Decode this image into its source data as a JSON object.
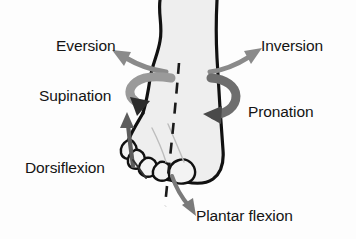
{
  "figure": {
    "background_color": "#fdfdfd",
    "text_color": "#141414"
  },
  "anatomy": {
    "subject": "right foot and lower leg, anterior view",
    "skin_fill": "#eeeeee",
    "outline_color": "#111111",
    "axis": {
      "name": "longitudinal-axis",
      "style": "dashed",
      "color": "#1a1a1a"
    }
  },
  "labels": {
    "eversion": "Eversion",
    "inversion": "Inversion",
    "supination": "Supination",
    "pronation": "Pronation",
    "dorsiflexion": "Dorsiflexion",
    "plantar_flexion": "Plantar flexion"
  },
  "arrows": [
    {
      "name": "eversion-arrow",
      "points_to": "Eversion",
      "direction": "up-left",
      "style": "straight",
      "color": "#8a8a8a"
    },
    {
      "name": "inversion-arrow",
      "points_to": "Inversion",
      "direction": "up-right",
      "style": "straight",
      "color": "#8a8a8a"
    },
    {
      "name": "supination-arrow",
      "points_to": "Supination",
      "direction": "curved-hook-down",
      "style": "ribbon",
      "color": "#9a9a9a"
    },
    {
      "name": "pronation-arrow",
      "points_to": "Pronation",
      "direction": "curved-loop-left",
      "style": "ribbon",
      "color": "#6e6e6e"
    },
    {
      "name": "dorsiflexion-arrow",
      "points_to": "Dorsiflexion",
      "direction": "up",
      "style": "curved",
      "color": "#5d5d5d"
    },
    {
      "name": "plantar-flexion-arrow",
      "points_to": "Plantar flexion",
      "direction": "down-right",
      "style": "curved",
      "color": "#7a7a7a"
    }
  ],
  "leader_lines": [
    {
      "name": "dorsiflexion-leader-line",
      "from": "Dorsiflexion",
      "color": "#333333"
    }
  ]
}
